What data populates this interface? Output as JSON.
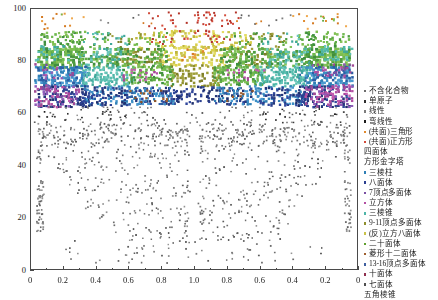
{
  "chart_data": {
    "type": "scatter",
    "title": "",
    "xlabel": "",
    "ylabel": "",
    "xlim": [
      0,
      1
    ],
    "ylim": [
      0,
      100
    ],
    "grid": false,
    "legend_position": "right",
    "x_tick_labels": [
      "0",
      "0.2",
      "0.4",
      "0.6",
      "0.8",
      "1.0",
      "0.8",
      "0.6",
      "0.4",
      "0.2",
      "0"
    ],
    "x_tick_positions": [
      0.0,
      0.1,
      0.2,
      0.3,
      0.4,
      0.5,
      0.6,
      0.7,
      0.8,
      0.9,
      1.0
    ],
    "y_tick_labels": [
      "0",
      "20",
      "40",
      "60",
      "80",
      "100"
    ],
    "y_tick_values": [
      0,
      20,
      40,
      60,
      80,
      100
    ],
    "series": [
      {
        "name": "不含化合物",
        "color": "#6c6c6c",
        "marker": "square"
      },
      {
        "name": "单原子",
        "color": "#2f2f2f",
        "marker": "square"
      },
      {
        "name": "线性",
        "color": "#7d7d7d",
        "marker": "square"
      },
      {
        "name": "弯线性",
        "color": "#1d1d1d",
        "marker": "square"
      },
      {
        "name": "(共面)三角形",
        "color": "#e08a2e",
        "marker": "square"
      },
      {
        "name": "(共面)正方形",
        "color": "#d24b3a",
        "marker": "square"
      },
      {
        "name": "四面体",
        "color": "#3f8f3f",
        "marker": "square"
      },
      {
        "name": "方形金字塔",
        "color": "#7fbf4f",
        "marker": "square"
      },
      {
        "name": "三棱柱",
        "color": "#2f7fb5",
        "marker": "square"
      },
      {
        "name": "八面体",
        "color": "#2b3f8f",
        "marker": "square"
      },
      {
        "name": "7顶点多面体",
        "color": "#7a4fa3",
        "marker": "square"
      },
      {
        "name": "立方体",
        "color": "#b34fa3",
        "marker": "square"
      },
      {
        "name": "三棱锥",
        "color": "#4fb5a8",
        "marker": "square"
      },
      {
        "name": "9-11顶点多面体",
        "color": "#8f8f2f",
        "marker": "square"
      },
      {
        "name": "(反)立方八面体",
        "color": "#c9c24a",
        "marker": "square"
      },
      {
        "name": "二十面体",
        "color": "#5f9f2f",
        "marker": "square"
      },
      {
        "name": "菱形十二面体",
        "color": "#9f5f2f",
        "marker": "square"
      },
      {
        "name": "13-16顶点多面体",
        "color": "#3f5f9f",
        "marker": "square"
      },
      {
        "name": "十面体",
        "color": "#8f2f4f",
        "marker": "square"
      },
      {
        "name": "七面体",
        "color": "#4f4f4f",
        "marker": "square"
      },
      {
        "name": "五角棱锥",
        "color": "#6f9f8f",
        "marker": "square"
      }
    ]
  }
}
